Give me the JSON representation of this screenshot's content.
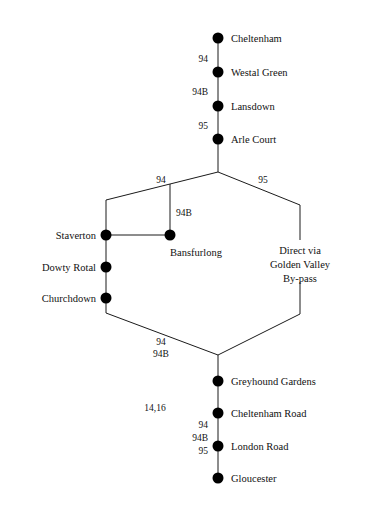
{
  "diagram": {
    "background_color": "#ffffff",
    "line_color": "#1a1a1a",
    "node_color": "#000000"
  },
  "stations": {
    "cheltenham": "Cheltenham",
    "westal_green": "Westal Green",
    "lansdown": "Lansdown",
    "arle_court": "Arle Court",
    "staverton": "Staverton",
    "dowty_rotal": "Dowty Rotal",
    "churchdown": "Churchdown",
    "bansfurlong": "Bansfurlong",
    "greyhound_gardens": "Greyhound Gardens",
    "cheltenham_road": "Cheltenham Road",
    "london_road": "London Road",
    "gloucester": "Gloucester"
  },
  "route_numbers": {
    "top_94": "94",
    "top_94b": "94B",
    "top_95": "95",
    "branch_left_94": "94",
    "branch_right_95": "95",
    "spur_94b": "94B",
    "lower_left_94": "94",
    "lower_left_94b": "94B",
    "mid_1416": "14,16",
    "bottom_94": "94",
    "bottom_94b": "94B",
    "bottom_95": "95"
  },
  "notes": {
    "direct_line_1": "Direct via",
    "direct_line_2": "Golden Valley",
    "direct_line_3": "By-pass"
  }
}
